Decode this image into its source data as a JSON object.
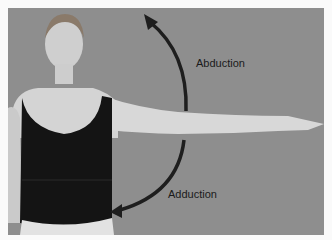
{
  "figure": {
    "labels": {
      "abduction": "Abduction",
      "adduction": "Adduction"
    },
    "colors": {
      "background": "#8e8e8e",
      "arrow": "#1e1e1e",
      "tank_top": "#141414",
      "skin": "#d6d6d6"
    }
  }
}
